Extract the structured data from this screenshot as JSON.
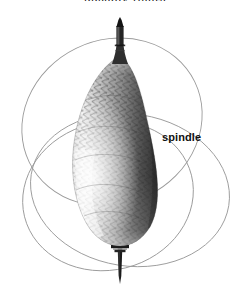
{
  "figure": {
    "background_color": "#ffffff",
    "width": 250,
    "height": 290,
    "top_caption": "ppendix figure",
    "labels": [
      {
        "id": "spindle",
        "text": "spindle",
        "x": 162,
        "y": 131,
        "weight": "bold",
        "color": "#111111"
      }
    ],
    "subject": {
      "name": "spindle",
      "description": "tapered spindle with cross-hatched wound-thread body, banded collar and pointed shaft",
      "body_color_dark": "#3b3b3b",
      "body_color_mid": "#8a8a8a",
      "body_color_light": "#e8e8e8",
      "shaft_color": "#1a1a1a",
      "collar_color": "#222222",
      "body_top_y": 58,
      "body_bottom_y": 243,
      "body_left_x": 72,
      "body_right_x": 152,
      "tip_top_y": 18,
      "shaft_bottom_y": 284,
      "axis_x": 120
    },
    "orbits": {
      "stroke_color": "#9a9a9a",
      "stroke_width": 0.9,
      "count": 3,
      "description": "three overlapping thin elliptical loops encircling the spindle",
      "left_extent_x": 18,
      "right_extent_x": 232,
      "top_extent_y": 40,
      "bottom_extent_y": 272
    }
  }
}
